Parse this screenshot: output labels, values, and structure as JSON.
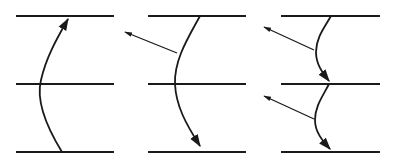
{
  "diagram": {
    "title": "",
    "colors": {
      "line": "#1a1a1a",
      "background": "#ffffff"
    },
    "panels": [
      {
        "id": "panel-1",
        "description": "Single curved arrow crossing middle line, pointing upward"
      },
      {
        "id": "panel-2",
        "description": "Curved arrow pointing downward, with one emitted straight arrow to upper-left"
      },
      {
        "id": "panel-3",
        "description": "Two curved downward arrow segments, each emitting a straight arrow to upper-left"
      }
    ]
  }
}
